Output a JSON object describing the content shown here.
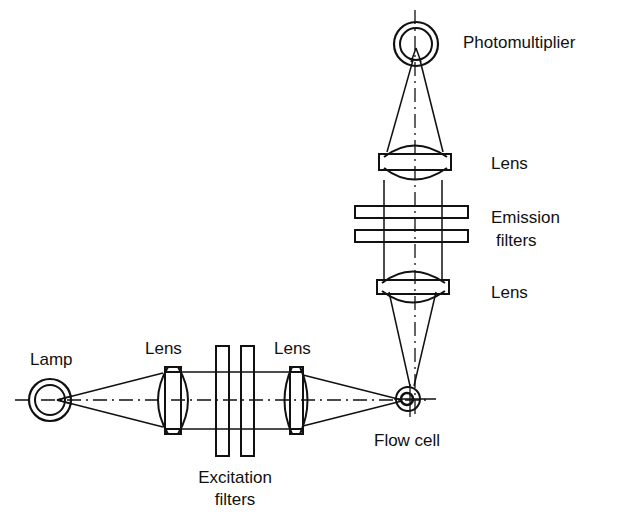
{
  "labels": {
    "lamp": "Lamp",
    "lens_excitation_1": "Lens",
    "lens_excitation_2": "Lens",
    "excitation_filters_line1": "Excitation",
    "excitation_filters_line2": "filters",
    "flow_cell": "Flow cell",
    "photomultiplier": "Photomultiplier",
    "lens_emission_upper": "Lens",
    "emission_filters_line1": "Emission",
    "emission_filters_line2": "filters",
    "lens_emission_lower": "Lens"
  },
  "colors": {
    "stroke": "#111111",
    "background": "#ffffff"
  }
}
